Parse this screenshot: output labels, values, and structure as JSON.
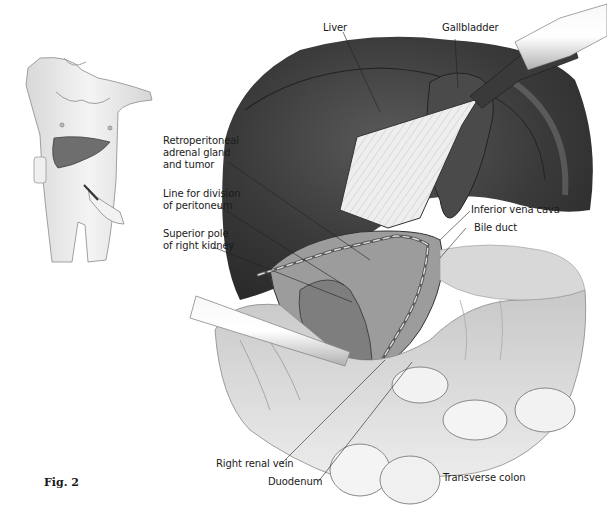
{
  "figure": {
    "label": "Fig. 2",
    "inset": {
      "description": "Patient body outline with liver highlighted and laparoscopic port inserted",
      "organ_color": "#6e6e6e"
    },
    "main": {
      "description": "Laparoscopic view of right adrenalectomy with retracted liver",
      "labels": {
        "liver": "Liver",
        "gallbladder": "Gallbladder",
        "retroperitoneal": "Retroperitoneal\nadrenal gland\nand tumor",
        "division_line": "Line for division\nof peritoneum",
        "superior_pole": "Superior pole\nof right kidney",
        "inferior_vena_cava": "Inferior vena cava",
        "bile_duct": "Bile duct",
        "right_renal_vein": "Right renal vein",
        "duodenum": "Duodenum",
        "transverse_colon": "Transverse colon"
      }
    }
  }
}
